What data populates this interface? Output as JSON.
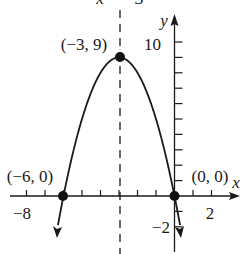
{
  "chart_data": {
    "type": "line",
    "title": "",
    "function": "y = -x^2 - 6x",
    "xlabel": "x",
    "ylabel": "y",
    "xlim": [
      -8.3,
      3.5
    ],
    "ylim": [
      -3.5,
      11.5
    ],
    "x_tick_labels": [
      "-8",
      "2"
    ],
    "y_tick_labels": [
      "10",
      "-2"
    ],
    "axis_of_symmetry": {
      "label": "x = -3",
      "x": -3
    },
    "points": [
      {
        "label": "(-3, 9)",
        "x": -3,
        "y": 9
      },
      {
        "label": "(-6, 0)",
        "x": -6,
        "y": 0
      },
      {
        "label": "(0, 0)",
        "x": 0,
        "y": 0
      }
    ],
    "grid": false
  },
  "labels": {
    "axis_sym": "x = −3",
    "y_axis": "y",
    "x_axis": "x",
    "vertex": "(−3, 9)",
    "left_root": "(−6, 0)",
    "right_root": "(0, 0)",
    "tick_x_neg8": "−8",
    "tick_x_2": "2",
    "tick_y_10": "10",
    "tick_y_neg2": "−2"
  }
}
